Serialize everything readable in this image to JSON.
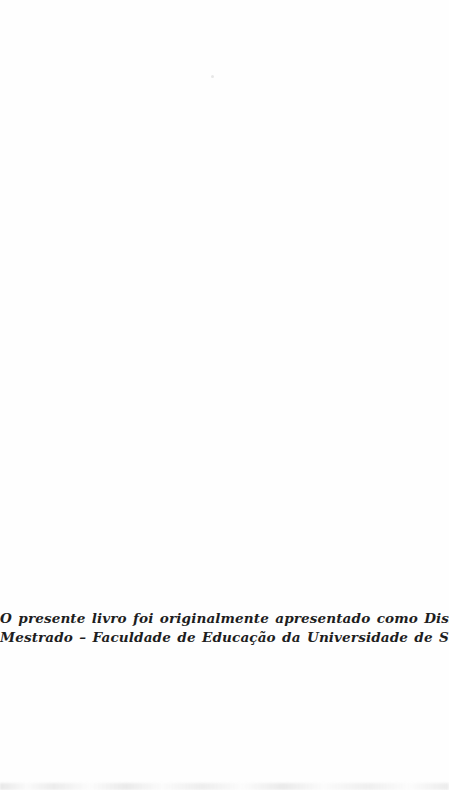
{
  "page": {
    "background_color": "#fefefe",
    "text_color": "#1e1e1e",
    "imprint_note": {
      "line1": "O presente livro foi originalmente apresentado como Dissertação de",
      "line2": "Mestrado – Faculdade de Educação da Universidade de São Paulo."
    }
  }
}
